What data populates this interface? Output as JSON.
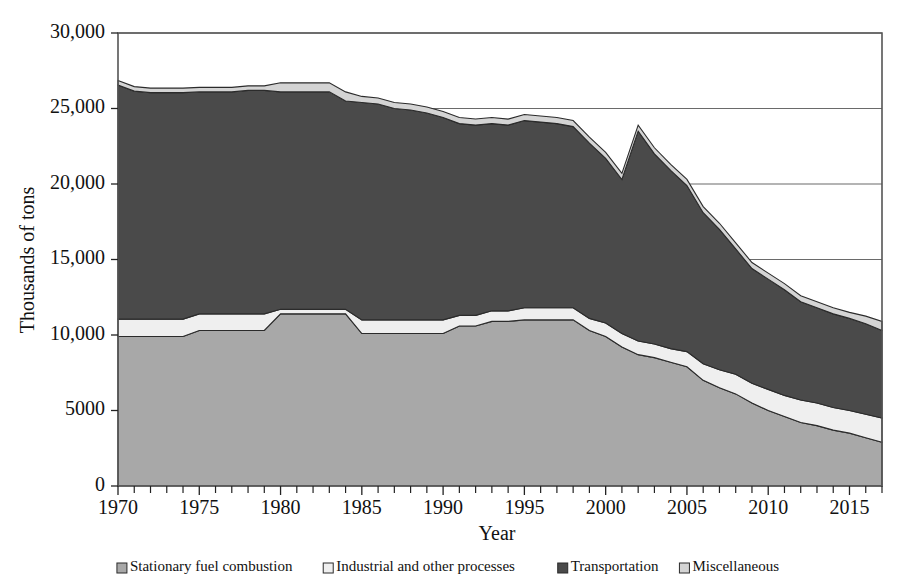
{
  "chart_data": {
    "type": "area",
    "stacked": true,
    "title": "",
    "xlabel": "Year",
    "ylabel": "Thousands of tons",
    "xlim": [
      1970,
      2017
    ],
    "ylim": [
      0,
      30000
    ],
    "grid": "horizontal",
    "legend_position": "bottom",
    "y_ticks": [
      0,
      5000,
      10000,
      15000,
      20000,
      25000,
      30000
    ],
    "y_tick_labels": [
      "0",
      "5000",
      "10,000",
      "15,000",
      "20,000",
      "25,000",
      "30,000"
    ],
    "x_ticks": [
      1970,
      1975,
      1980,
      1985,
      1990,
      1995,
      2000,
      2005,
      2010,
      2015
    ],
    "x_tick_labels": [
      "1970",
      "1975",
      "1980",
      "1985",
      "1990",
      "1995",
      "2000",
      "2005",
      "2010",
      "2015"
    ],
    "x_minor_tick_interval": 1,
    "x": [
      1970,
      1971,
      1972,
      1973,
      1974,
      1975,
      1976,
      1977,
      1978,
      1979,
      1980,
      1981,
      1982,
      1983,
      1984,
      1985,
      1986,
      1987,
      1988,
      1989,
      1990,
      1991,
      1992,
      1993,
      1994,
      1995,
      1996,
      1997,
      1998,
      1999,
      2000,
      2001,
      2002,
      2003,
      2004,
      2005,
      2006,
      2007,
      2008,
      2009,
      2010,
      2011,
      2012,
      2013,
      2014,
      2015,
      2016,
      2017
    ],
    "series": [
      {
        "name": "Stationary fuel combustion",
        "color": "#a8a8a8",
        "values": [
          9900,
          9900,
          9900,
          9900,
          9900,
          10300,
          10300,
          10300,
          10300,
          10300,
          11400,
          11400,
          11400,
          11400,
          11400,
          10100,
          10100,
          10100,
          10100,
          10100,
          10100,
          10600,
          10600,
          10900,
          10900,
          11000,
          11000,
          11000,
          11000,
          10300,
          9900,
          9200,
          8700,
          8500,
          8200,
          7900,
          7000,
          6500,
          6100,
          5500,
          5000,
          4600,
          4200,
          4000,
          3700,
          3500,
          3200,
          2900
        ]
      },
      {
        "name": "Industrial and other processes",
        "color": "#efefef",
        "values": [
          1150,
          1150,
          1150,
          1150,
          1150,
          1100,
          1100,
          1100,
          1100,
          1100,
          300,
          300,
          300,
          300,
          300,
          900,
          900,
          900,
          900,
          900,
          900,
          700,
          700,
          700,
          700,
          800,
          800,
          800,
          800,
          800,
          900,
          900,
          900,
          900,
          900,
          1000,
          1100,
          1200,
          1300,
          1300,
          1400,
          1400,
          1500,
          1500,
          1500,
          1500,
          1550,
          1600
        ]
      },
      {
        "name": "Transportation",
        "color": "#4a4a4a",
        "values": [
          15500,
          15100,
          15000,
          15000,
          15000,
          14700,
          14700,
          14700,
          14800,
          14800,
          14400,
          14400,
          14400,
          14400,
          13800,
          14400,
          14300,
          14000,
          13900,
          13700,
          13400,
          12700,
          12600,
          12400,
          12300,
          12400,
          12300,
          12200,
          12000,
          11600,
          10900,
          10200,
          13900,
          12600,
          11800,
          11000,
          10000,
          9300,
          8300,
          7600,
          7300,
          7000,
          6500,
          6300,
          6200,
          6100,
          6000,
          5800
        ]
      },
      {
        "name": "Miscellaneous",
        "color": "#d4d4d4",
        "values": [
          300,
          300,
          300,
          300,
          300,
          300,
          300,
          300,
          300,
          300,
          600,
          600,
          600,
          600,
          600,
          400,
          400,
          400,
          400,
          400,
          400,
          400,
          400,
          400,
          400,
          400,
          400,
          400,
          400,
          400,
          400,
          400,
          400,
          400,
          400,
          400,
          400,
          400,
          400,
          400,
          400,
          400,
          400,
          400,
          400,
          400,
          500,
          600
        ]
      }
    ]
  },
  "legend": {
    "items": [
      {
        "label": "Stationary fuel combustion",
        "swatch": "#a8a8a8"
      },
      {
        "label": "Industrial and other processes",
        "swatch": "#efefef"
      },
      {
        "label": "Transportation",
        "swatch": "#4a4a4a"
      },
      {
        "label": "Miscellaneous",
        "swatch": "#d4d4d4"
      }
    ]
  }
}
